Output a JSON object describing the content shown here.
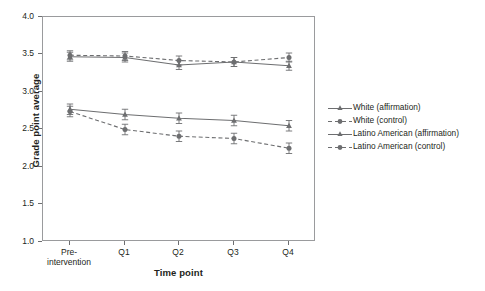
{
  "chart_data": {
    "type": "line",
    "title": "",
    "xlabel": "Time point",
    "ylabel": "Grade point average",
    "categories": [
      "Pre-intervention",
      "Q1",
      "Q2",
      "Q3",
      "Q4"
    ],
    "xtick_labels": [
      "Pre-\nintervention",
      "Q1",
      "Q2",
      "Q3",
      "Q4"
    ],
    "ylim": [
      1.0,
      4.0
    ],
    "ytick_labels": [
      "1.0",
      "1.5",
      "2.0",
      "2.5",
      "3.0",
      "3.5",
      "4.0"
    ],
    "ytick_values": [
      1.0,
      1.5,
      2.0,
      2.5,
      3.0,
      3.5,
      4.0
    ],
    "grid": false,
    "legend_position": "right",
    "series": [
      {
        "name": "White (affirmation)",
        "marker": "triangle",
        "line_style": "solid",
        "color": "#6d6e70",
        "values": [
          3.47,
          3.46,
          3.36,
          3.4,
          3.35
        ],
        "errors": [
          0.06,
          0.06,
          0.06,
          0.06,
          0.06
        ]
      },
      {
        "name": "White (control)",
        "marker": "circle",
        "line_style": "dashed",
        "color": "#6d6e70",
        "values": [
          3.49,
          3.48,
          3.42,
          3.4,
          3.46
        ],
        "errors": [
          0.06,
          0.06,
          0.06,
          0.06,
          0.06
        ]
      },
      {
        "name": "Latino American (affirmation)",
        "marker": "triangle",
        "line_style": "solid",
        "color": "#6d6e70",
        "values": [
          2.77,
          2.7,
          2.65,
          2.62,
          2.55
        ],
        "errors": [
          0.07,
          0.07,
          0.07,
          0.07,
          0.07
        ]
      },
      {
        "name": "Latino American (control)",
        "marker": "circle",
        "line_style": "dashed",
        "color": "#6d6e70",
        "values": [
          2.74,
          2.5,
          2.41,
          2.38,
          2.25
        ],
        "errors": [
          0.07,
          0.07,
          0.07,
          0.07,
          0.07
        ]
      }
    ]
  },
  "axes": {
    "y_title": "Grade point average",
    "x_title": "Time point",
    "ytick_0": "1.0",
    "ytick_1": "1.5",
    "ytick_2": "2.0",
    "ytick_3": "2.5",
    "ytick_4": "3.0",
    "ytick_5": "3.5",
    "ytick_6": "4.0",
    "xtick_0_line1": "Pre-",
    "xtick_0_line2": "intervention",
    "xtick_1": "Q1",
    "xtick_2": "Q2",
    "xtick_3": "Q3",
    "xtick_4": "Q4"
  },
  "legend": {
    "items": [
      {
        "label": "White (affirmation)"
      },
      {
        "label": "White (control)"
      },
      {
        "label": "Latino American (affirmation)"
      },
      {
        "label": "Latino American (control)"
      }
    ]
  },
  "colors": {
    "line": "#6d6e70",
    "frame": "#9a9b9d",
    "text": "#231f20",
    "background": "#ffffff"
  }
}
